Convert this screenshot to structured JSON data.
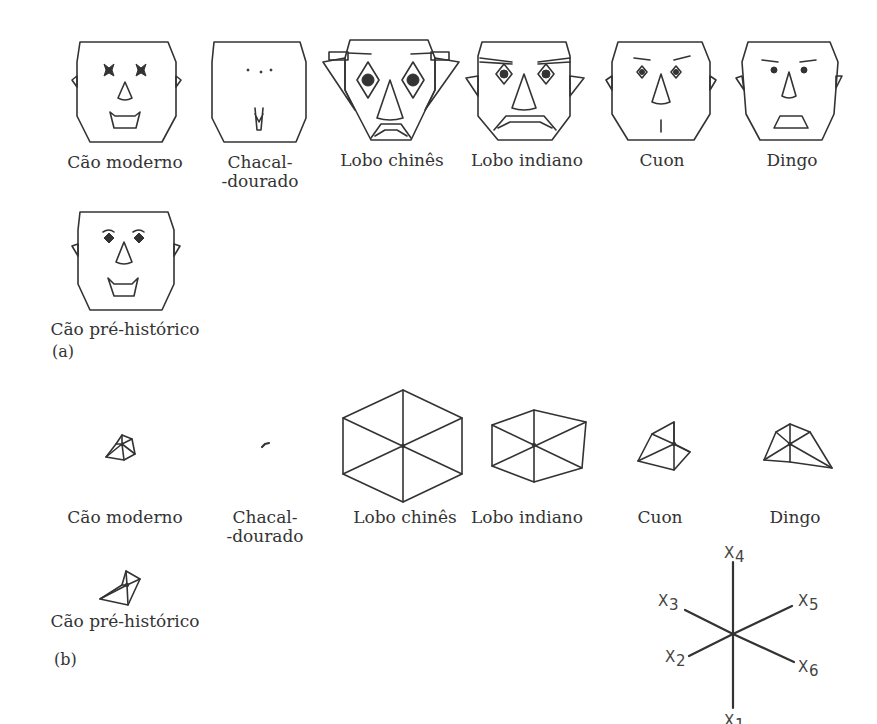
{
  "figure": {
    "panel_a_label": "(a)",
    "panel_b_label": "(b)"
  },
  "faces": [
    {
      "label_1": "Cão moderno",
      "label_2": ""
    },
    {
      "label_1": "Chacal-",
      "label_2": "-dourado"
    },
    {
      "label_1": "Lobo chinês",
      "label_2": ""
    },
    {
      "label_1": "Lobo indiano",
      "label_2": ""
    },
    {
      "label_1": "Cuon",
      "label_2": ""
    },
    {
      "label_1": "Dingo",
      "label_2": ""
    },
    {
      "label_1": "Cão pré-histórico",
      "label_2": ""
    }
  ],
  "stars": [
    {
      "label_1": "Cão moderno",
      "label_2": ""
    },
    {
      "label_1": "Chacal-",
      "label_2": "-dourado"
    },
    {
      "label_1": "Lobo chinês",
      "label_2": ""
    },
    {
      "label_1": "Lobo indiano",
      "label_2": ""
    },
    {
      "label_1": "Cuon",
      "label_2": ""
    },
    {
      "label_1": "Dingo",
      "label_2": ""
    },
    {
      "label_1": "Cão pré-histórico",
      "label_2": ""
    }
  ],
  "axes_key": {
    "x1": "X",
    "x1_sub": "1",
    "x2": "X",
    "x2_sub": "2",
    "x3": "X",
    "x3_sub": "3",
    "x4": "X",
    "x4_sub": "4",
    "x5": "X",
    "x5_sub": "5",
    "x6": "X",
    "x6_sub": "6"
  }
}
